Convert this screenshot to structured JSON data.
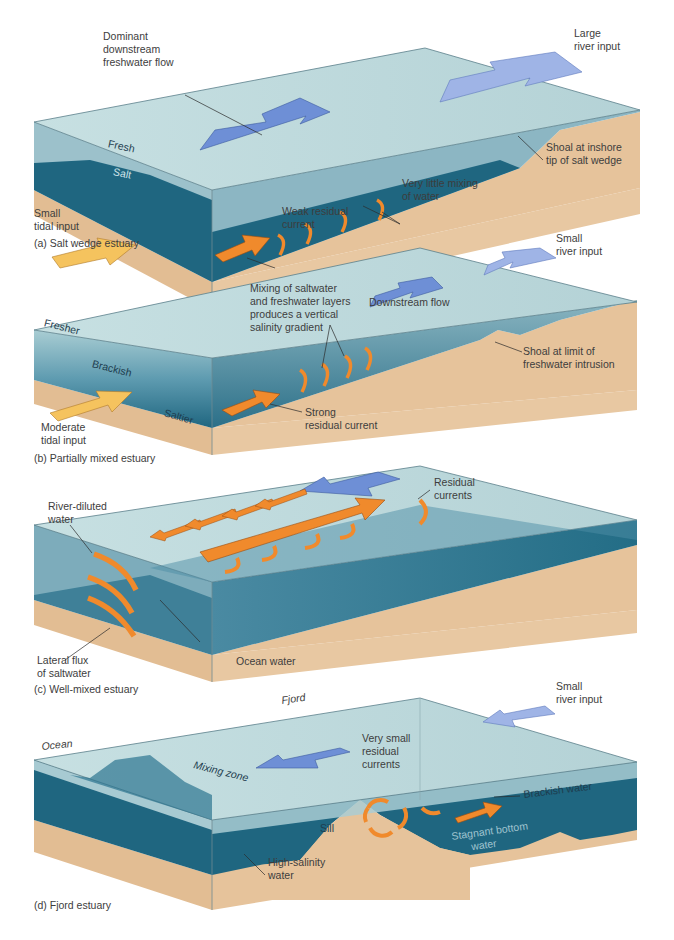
{
  "figure": {
    "colors": {
      "surface_water": "#b9d6d9",
      "fresh_layer": "#8fb9c4",
      "mid_water": "#5f9aae",
      "salt_water": "#1f6680",
      "deep_water": "#19617a",
      "sediment": "#e6c39b",
      "sediment_dark": "#d9b186",
      "blue_arrow": "#6e8fd6",
      "blue_arrow_light": "#9fb4e6",
      "orange_arrow": "#f08a2c",
      "yellow_arrow": "#f5c35e"
    },
    "panels": [
      {
        "id": "a",
        "caption": "(a) Salt wedge estuary",
        "labels": {
          "dominant_flow": [
            "Dominant",
            "downstream",
            "freshwater flow"
          ],
          "river_input": [
            "Large",
            "river input"
          ],
          "fresh": "Fresh",
          "salt": "Salt",
          "shoal": [
            "Shoal at inshore",
            "tip of salt wedge"
          ],
          "mixing": [
            "Very little mixing",
            "of water"
          ],
          "residual": [
            "Weak residual",
            "current"
          ],
          "tidal": [
            "Small",
            "tidal input"
          ]
        }
      },
      {
        "id": "b",
        "caption": "(b) Partially mixed estuary",
        "labels": {
          "river_input": [
            "Small",
            "river input"
          ],
          "mixing": [
            "Mixing of saltwater",
            "and freshwater layers",
            "produces a vertical",
            "salinity gradient"
          ],
          "downstream": "Downstream flow",
          "fresher": "Fresher",
          "brackish": "Brackish",
          "saltier": "Saltier",
          "shoal": [
            "Shoal at limit of",
            "freshwater intrusion"
          ],
          "residual": [
            "Strong",
            "residual current"
          ],
          "tidal": [
            "Moderate",
            "tidal input"
          ]
        }
      },
      {
        "id": "c",
        "caption": "(c) Well-mixed estuary",
        "labels": {
          "river_diluted": [
            "River-diluted",
            "water"
          ],
          "residual": [
            "Residual",
            "currents"
          ],
          "lateral": [
            "Lateral flux",
            "of saltwater"
          ],
          "ocean": "Ocean water"
        }
      },
      {
        "id": "d",
        "caption": "(d) Fjord estuary",
        "labels": {
          "fjord": "Fjord",
          "ocean": "Ocean",
          "river_input": [
            "Small",
            "river input"
          ],
          "residual": [
            "Very small",
            "residual",
            "currents"
          ],
          "mixing_zone": "Mixing zone",
          "brackish": "Brackish water",
          "sill": "Sill",
          "stagnant": [
            "Stagnant bottom",
            "water"
          ],
          "high_salinity": [
            "High-salinity",
            "water"
          ]
        }
      }
    ]
  }
}
